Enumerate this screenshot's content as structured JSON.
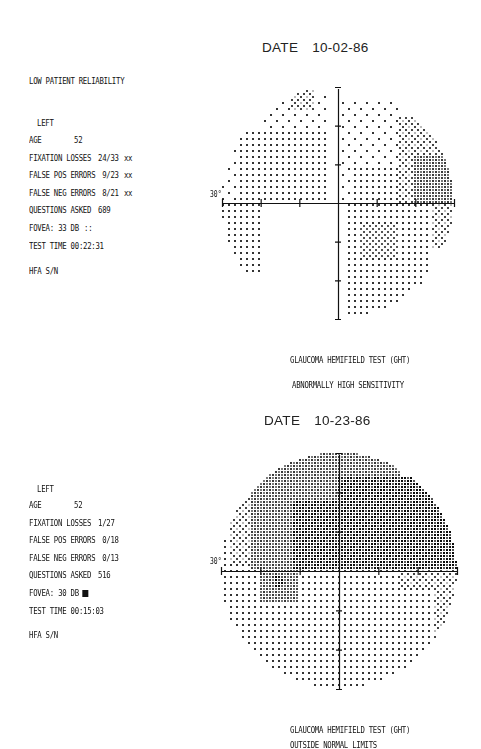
{
  "tests": [
    {
      "id": "test-1",
      "date_label": "DATE",
      "date_value": "10-02-86",
      "reliability_note": "LOW PATIENT RELIABILITY",
      "eye": "LEFT",
      "fields": [
        {
          "key": "AGE",
          "value": "52",
          "flag": ""
        },
        {
          "key": "FIXATION LOSSES",
          "value": "24/33",
          "flag": "xx"
        },
        {
          "key": "FALSE POS ERRORS",
          "value": "9/23",
          "flag": "xx"
        },
        {
          "key": "FALSE NEG ERRORS",
          "value": "8/21",
          "flag": "xx"
        },
        {
          "key": "QUESTIONS ASKED",
          "value": "689",
          "flag": ""
        },
        {
          "key": "FOVEA:",
          "value": "33 DB",
          "flag": "::"
        },
        {
          "key": "TEST TIME",
          "value": "00:22:31",
          "flag": ""
        }
      ],
      "serial_label": "HFA S/N",
      "axis_label": "30°",
      "ght_title": "GLAUCOMA HEMIFIELD TEST (GHT)",
      "ght_result": "ABNORMALLY HIGH SENSITIVITY"
    },
    {
      "id": "test-2",
      "date_label": "DATE",
      "date_value": "10-23-86",
      "reliability_note": "",
      "eye": "LEFT",
      "fields": [
        {
          "key": "AGE",
          "value": "52",
          "flag": ""
        },
        {
          "key": "FIXATION LOSSES",
          "value": "1/27",
          "flag": ""
        },
        {
          "key": "FALSE POS ERRORS",
          "value": "0/18",
          "flag": ""
        },
        {
          "key": "FALSE NEG ERRORS",
          "value": "0/13",
          "flag": ""
        },
        {
          "key": "QUESTIONS ASKED",
          "value": "516",
          "flag": ""
        },
        {
          "key": "FOVEA:",
          "value": "30 DB",
          "flag": "■"
        },
        {
          "key": "TEST TIME",
          "value": "00:15:03",
          "flag": ""
        }
      ],
      "serial_label": "HFA S/N",
      "axis_label": "30°",
      "ght_title": "GLAUCOMA HEMIFIELD TEST (GHT)",
      "ght_result": "OUTSIDE NORMAL LIMITS"
    }
  ],
  "chart_data": [
    {
      "type": "heatmap",
      "title": "Visual field greyscale, LEFT eye, 10-02-86",
      "xlabel": "",
      "ylabel": "",
      "axis_range_deg": [
        -30,
        30
      ],
      "tick_spacing_deg": 10,
      "annotations": [
        "30°"
      ],
      "center": [
        338,
        203
      ],
      "radius_px": 116,
      "grey_levels": {
        "0": "blank",
        "1": "sparse dots",
        "2": "dense dots",
        "3": "fine dot grid",
        "4": "diamond hatch",
        "5": "dark grey",
        "6": "black"
      },
      "zones": [
        {
          "q": "sup-nasal-left",
          "x0": -30,
          "x1": -18,
          "y0": 0,
          "y1": 14,
          "level": 1
        },
        {
          "q": "sup-left",
          "x0": -26,
          "x1": -2,
          "y0": 0,
          "y1": 18,
          "level": 2
        },
        {
          "q": "sup-left-top",
          "x0": -20,
          "x1": -2,
          "y0": 18,
          "y1": 28,
          "level": 1
        },
        {
          "q": "sup-left-spot",
          "x0": -12,
          "x1": -6,
          "y0": 24,
          "y1": 30,
          "level": 4
        },
        {
          "q": "sup-right",
          "x0": 0,
          "x1": 16,
          "y0": 0,
          "y1": 26,
          "level": 1
        },
        {
          "q": "sup-right-dense",
          "x0": 4,
          "x1": 20,
          "y0": 0,
          "y1": 10,
          "level": 2
        },
        {
          "q": "sup-right-ring",
          "x0": 16,
          "x1": 22,
          "y0": 0,
          "y1": 22,
          "level": 4
        },
        {
          "q": "sup-right-dark",
          "x0": 20,
          "x1": 30,
          "y0": 0,
          "y1": 12,
          "level": 5
        },
        {
          "q": "sup-right-ring2",
          "x0": 20,
          "x1": 28,
          "y0": 12,
          "y1": 24,
          "level": 4
        },
        {
          "q": "inf-left",
          "x0": -30,
          "x1": -20,
          "y0": -18,
          "y1": 0,
          "level": 2
        },
        {
          "q": "inf-left-tail",
          "x0": -28,
          "x1": -24,
          "y0": -18,
          "y1": -10,
          "level": 1
        },
        {
          "q": "inf-right",
          "x0": 2,
          "x1": 24,
          "y0": -30,
          "y1": 0,
          "level": 2
        },
        {
          "q": "inf-right-spot",
          "x0": 6,
          "x1": 16,
          "y0": -14,
          "y1": -6,
          "level": 3
        },
        {
          "q": "inf-right-ring",
          "x0": 24,
          "x1": 30,
          "y0": -12,
          "y1": 0,
          "level": 4
        }
      ]
    },
    {
      "type": "heatmap",
      "title": "Visual field greyscale, LEFT eye, 10-23-86",
      "xlabel": "",
      "ylabel": "",
      "axis_range_deg": [
        -30,
        30
      ],
      "tick_spacing_deg": 10,
      "annotations": [
        "30°"
      ],
      "center": [
        339,
        571
      ],
      "radius_px": 118,
      "grey_levels": {
        "0": "blank",
        "1": "sparse dots",
        "2": "dense dots",
        "3": "fine dot grid",
        "4": "diamond hatch",
        "5": "dark grey",
        "6": "black"
      },
      "zones": [
        {
          "q": "sup-left-outer",
          "x0": -30,
          "x1": -16,
          "y0": 0,
          "y1": 12,
          "level": 2
        },
        {
          "q": "sup-left-hatch",
          "x0": -28,
          "x1": -16,
          "y0": 2,
          "y1": 22,
          "level": 4
        },
        {
          "q": "sup-left-grey",
          "x0": -22,
          "x1": 0,
          "y0": 0,
          "y1": 30,
          "level": 5
        },
        {
          "q": "sup-left-black",
          "x0": -12,
          "x1": 0,
          "y0": 0,
          "y1": 18,
          "level": 6
        },
        {
          "q": "sup-right-grey",
          "x0": 0,
          "x1": 16,
          "y0": 8,
          "y1": 30,
          "level": 5
        },
        {
          "q": "sup-right-black",
          "x0": 0,
          "x1": 30,
          "y0": 0,
          "y1": 24,
          "level": 6
        },
        {
          "q": "sup-right-grey2",
          "x0": 4,
          "x1": 16,
          "y0": 8,
          "y1": 16,
          "level": 5
        },
        {
          "q": "inf-all",
          "x0": -30,
          "x1": 30,
          "y0": -30,
          "y1": 0,
          "level": 2
        },
        {
          "q": "inf-left-spot",
          "x0": -20,
          "x1": -10,
          "y0": -8,
          "y1": 0,
          "level": 5
        },
        {
          "q": "inf-left-black",
          "x0": -16,
          "x1": -14,
          "y0": -4,
          "y1": -1,
          "level": 6
        },
        {
          "q": "inf-right-ring",
          "x0": 16,
          "x1": 30,
          "y0": -4,
          "y1": 0,
          "level": 4
        },
        {
          "q": "inf-right-ring2",
          "x0": 24,
          "x1": 30,
          "y0": -18,
          "y1": -2,
          "level": 4
        }
      ]
    }
  ]
}
